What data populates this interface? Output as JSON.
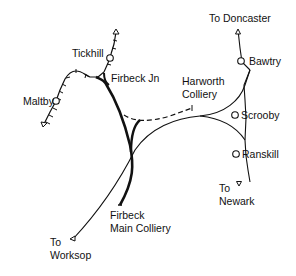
{
  "map": {
    "title": "",
    "stations": [
      {
        "name": "Tickhill"
      },
      {
        "name": "Maltby"
      },
      {
        "name": "Bawtry"
      },
      {
        "name": "Scrooby"
      },
      {
        "name": "Ranskill"
      }
    ],
    "junctions": [
      {
        "name": "Firbeck Jn"
      }
    ],
    "collieries": [
      {
        "line1": "Harworth",
        "line2": "Colliery"
      },
      {
        "line1": "Firbeck",
        "line2": "Main Colliery"
      }
    ],
    "destinations": [
      {
        "line1": "To Doncaster"
      },
      {
        "line1": "To",
        "line2": "Newark"
      },
      {
        "line1": "To",
        "line2": "Worksop"
      }
    ],
    "colors": {
      "line": "#111111",
      "background": "#ffffff"
    }
  }
}
